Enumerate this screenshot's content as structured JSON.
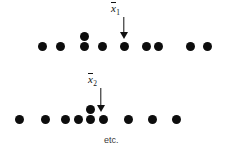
{
  "figure": {
    "title": "",
    "background_color": "#ffffff",
    "dot_color": "#0d0d0d",
    "arrow_color": "#111111",
    "etc_text": "etc.",
    "labels": {
      "mean1_base": "x",
      "mean1_sub": "1",
      "mean2_base": "x",
      "mean2_sub": "2"
    }
  },
  "chart_data": {
    "type": "scatter",
    "title": "",
    "xlabel": "",
    "ylabel": "",
    "grid": false,
    "legend_position": "none",
    "annotations": [
      {
        "name": "mean-1",
        "text": "x̄1",
        "x": 119,
        "y": 16,
        "kind": "arrow-label"
      },
      {
        "name": "mean-2",
        "text": "x̄2",
        "x": 96,
        "y": 72,
        "kind": "arrow-label"
      },
      {
        "name": "etc",
        "text": "etc.",
        "x": 104,
        "y": 138,
        "kind": "text"
      }
    ],
    "series": [
      {
        "name": "sample-1",
        "row": 1,
        "baseline_y": 46,
        "dot_diameter": 9,
        "points": [
          {
            "x": 42,
            "y": 46
          },
          {
            "x": 60,
            "y": 46
          },
          {
            "x": 84,
            "y": 46
          },
          {
            "x": 84,
            "y": 36
          },
          {
            "x": 102,
            "y": 46
          },
          {
            "x": 124,
            "y": 46
          },
          {
            "x": 146,
            "y": 46
          },
          {
            "x": 158,
            "y": 46
          },
          {
            "x": 190,
            "y": 46
          },
          {
            "x": 207,
            "y": 46
          }
        ]
      },
      {
        "name": "sample-2",
        "row": 2,
        "baseline_y": 119,
        "dot_diameter": 9,
        "points": [
          {
            "x": 19,
            "y": 119
          },
          {
            "x": 45,
            "y": 119
          },
          {
            "x": 65,
            "y": 119
          },
          {
            "x": 78,
            "y": 119
          },
          {
            "x": 90,
            "y": 119
          },
          {
            "x": 90,
            "y": 109
          },
          {
            "x": 103,
            "y": 119
          },
          {
            "x": 128,
            "y": 119
          },
          {
            "x": 152,
            "y": 119
          },
          {
            "x": 176,
            "y": 119
          }
        ]
      }
    ],
    "arrows": [
      {
        "name": "mean-1-arrow",
        "x": 119,
        "y_top": 17,
        "y_bottom": 39
      },
      {
        "name": "mean-2-arrow",
        "x": 96,
        "y_top": 88,
        "y_bottom": 112
      }
    ]
  }
}
